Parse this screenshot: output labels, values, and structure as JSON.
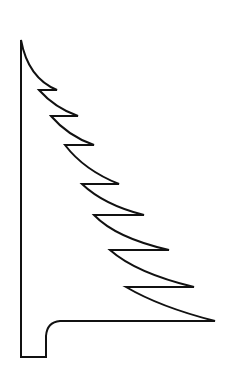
{
  "figure": {
    "stroke_color": "#111111",
    "background": "#ffffff",
    "stroke_width": 2
  }
}
